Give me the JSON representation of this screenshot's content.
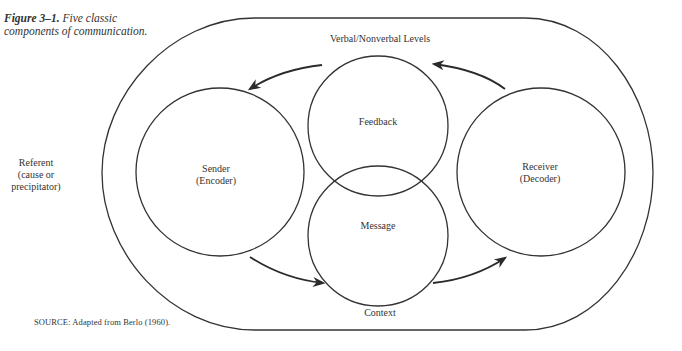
{
  "caption": {
    "figure_number": "Figure 3–1.",
    "text": "Five classic",
    "text_line2": "components of communication."
  },
  "source": "SOURCE: Adapted from Berlo (1960).",
  "diagram": {
    "outer_top_label": "Verbal/Nonverbal Levels",
    "outer_bottom_label": "Context",
    "referent": {
      "line1": "Referent",
      "line2": "(cause or",
      "line3": "precipitator)"
    },
    "nodes": [
      {
        "id": "sender",
        "line1": "Sender",
        "line2": "(Encoder)"
      },
      {
        "id": "feedback",
        "line1": "Feedback"
      },
      {
        "id": "message",
        "line1": "Message"
      },
      {
        "id": "receiver",
        "line1": "Receiver",
        "line2": "(Decoder)"
      }
    ],
    "flows": [
      {
        "from": "sender",
        "to": "message"
      },
      {
        "from": "message",
        "to": "receiver"
      },
      {
        "from": "receiver",
        "to": "feedback"
      },
      {
        "from": "feedback",
        "to": "sender"
      }
    ]
  }
}
